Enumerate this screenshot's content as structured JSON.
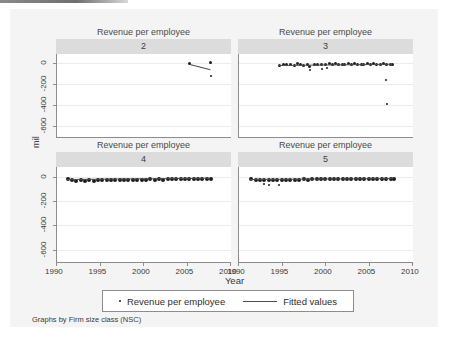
{
  "figure": {
    "y_axis_title": "mil",
    "x_axis_title": "Year",
    "note": "Graphs by Firm size class (NSC)",
    "panel_title": "Revenue per employee",
    "y_ticks": [
      "0",
      "-200",
      "-400",
      "-600"
    ],
    "x_ticks": [
      "1990",
      "1995",
      "2000",
      "2005",
      "2010"
    ],
    "legend": {
      "marker_label": "Revenue per employee",
      "line_label": "Fitted values"
    }
  },
  "chart_data": {
    "type": "scatter",
    "title": "Revenue per employee",
    "subtitle": "Graphs by Firm size class (NSC)",
    "xlabel": "Year",
    "ylabel": "mil",
    "xlim": [
      1990,
      2010
    ],
    "ylim": [
      -700,
      80
    ],
    "xticks": [
      1990,
      1995,
      2000,
      2005,
      2010
    ],
    "yticks": [
      0,
      -200,
      -400,
      -600
    ],
    "grid": true,
    "legend_position": "bottom",
    "legend": [
      "Revenue per employee",
      "Fitted values"
    ],
    "panel_variable": "Firm size class (NSC)",
    "panels": [
      {
        "label": "2",
        "series": [
          {
            "name": "Revenue per employee",
            "type": "scatter",
            "points": [
              {
                "x": 2005.2,
                "y": -8
              },
              {
                "x": 2007.6,
                "y": 5
              },
              {
                "x": 2007.7,
                "y": -128
              }
            ]
          },
          {
            "name": "Fitted values",
            "type": "line",
            "points": [
              {
                "x": 2005.3,
                "y": -14
              },
              {
                "x": 2007.6,
                "y": -62
              }
            ]
          }
        ]
      },
      {
        "label": "3",
        "series": [
          {
            "name": "Revenue per employee",
            "type": "scatter",
            "points": [
              {
                "x": 1994.6,
                "y": -22
              },
              {
                "x": 1995.0,
                "y": -18
              },
              {
                "x": 1995.4,
                "y": -14
              },
              {
                "x": 1995.9,
                "y": -10
              },
              {
                "x": 1996.3,
                "y": -20
              },
              {
                "x": 1996.7,
                "y": -6
              },
              {
                "x": 1997.0,
                "y": -12
              },
              {
                "x": 1997.4,
                "y": -24
              },
              {
                "x": 1997.8,
                "y": -16
              },
              {
                "x": 1998.1,
                "y": -30
              },
              {
                "x": 1998.2,
                "y": -70
              },
              {
                "x": 1998.6,
                "y": -14
              },
              {
                "x": 1999.0,
                "y": -12
              },
              {
                "x": 1999.4,
                "y": -18
              },
              {
                "x": 1999.5,
                "y": -58
              },
              {
                "x": 1999.9,
                "y": -10
              },
              {
                "x": 2000.1,
                "y": -54
              },
              {
                "x": 2000.3,
                "y": -8
              },
              {
                "x": 2000.7,
                "y": -14
              },
              {
                "x": 2001.0,
                "y": -6
              },
              {
                "x": 2001.4,
                "y": -16
              },
              {
                "x": 2001.8,
                "y": -10
              },
              {
                "x": 2002.1,
                "y": -12
              },
              {
                "x": 2002.5,
                "y": -8
              },
              {
                "x": 2002.9,
                "y": -14
              },
              {
                "x": 2003.2,
                "y": -6
              },
              {
                "x": 2003.6,
                "y": -12
              },
              {
                "x": 2004.0,
                "y": -10
              },
              {
                "x": 2004.3,
                "y": -14
              },
              {
                "x": 2004.7,
                "y": -8
              },
              {
                "x": 2005.1,
                "y": -12
              },
              {
                "x": 2005.4,
                "y": -6
              },
              {
                "x": 2005.8,
                "y": -10
              },
              {
                "x": 2006.2,
                "y": -14
              },
              {
                "x": 2006.5,
                "y": -8
              },
              {
                "x": 2006.9,
                "y": -12
              },
              {
                "x": 2006.9,
                "y": -160
              },
              {
                "x": 2007.0,
                "y": -390
              },
              {
                "x": 2007.3,
                "y": -10
              },
              {
                "x": 2007.6,
                "y": -14
              }
            ]
          },
          {
            "name": "Fitted values",
            "type": "line",
            "points": [
              {
                "x": 1994.6,
                "y": -26
              },
              {
                "x": 2007.6,
                "y": -14
              }
            ]
          }
        ]
      },
      {
        "label": "4",
        "series": [
          {
            "name": "Revenue per employee",
            "type": "scatter",
            "points": [
              {
                "x": 1991.2,
                "y": -14
              },
              {
                "x": 1991.6,
                "y": -20
              },
              {
                "x": 1992.1,
                "y": -24
              },
              {
                "x": 1992.6,
                "y": -22
              },
              {
                "x": 1993.1,
                "y": -26
              },
              {
                "x": 1993.6,
                "y": -22
              },
              {
                "x": 1994.1,
                "y": -24
              },
              {
                "x": 1994.6,
                "y": -20
              },
              {
                "x": 1995.1,
                "y": -22
              },
              {
                "x": 1995.6,
                "y": -18
              },
              {
                "x": 1996.1,
                "y": -20
              },
              {
                "x": 1996.6,
                "y": -18
              },
              {
                "x": 1997.1,
                "y": -20
              },
              {
                "x": 1997.6,
                "y": -16
              },
              {
                "x": 1998.1,
                "y": -18
              },
              {
                "x": 1998.6,
                "y": -16
              },
              {
                "x": 1999.1,
                "y": -18
              },
              {
                "x": 1999.6,
                "y": -16
              },
              {
                "x": 2000.1,
                "y": -16
              },
              {
                "x": 2000.6,
                "y": -14
              },
              {
                "x": 2001.1,
                "y": -16
              },
              {
                "x": 2001.6,
                "y": -14
              },
              {
                "x": 2002.1,
                "y": -16
              },
              {
                "x": 2002.6,
                "y": -14
              },
              {
                "x": 2003.1,
                "y": -14
              },
              {
                "x": 2003.6,
                "y": -12
              },
              {
                "x": 2004.1,
                "y": -14
              },
              {
                "x": 2004.6,
                "y": -12
              },
              {
                "x": 2005.1,
                "y": -14
              },
              {
                "x": 2005.6,
                "y": -12
              },
              {
                "x": 2006.1,
                "y": -12
              },
              {
                "x": 2006.6,
                "y": -12
              },
              {
                "x": 2007.1,
                "y": -12
              },
              {
                "x": 2007.6,
                "y": -10
              }
            ]
          },
          {
            "name": "Fitted values",
            "type": "line",
            "points": [
              {
                "x": 1991.2,
                "y": -22
              },
              {
                "x": 2007.6,
                "y": -12
              }
            ]
          }
        ]
      },
      {
        "label": "5",
        "series": [
          {
            "name": "Revenue per employee",
            "type": "scatter",
            "points": [
              {
                "x": 1991.3,
                "y": -12
              },
              {
                "x": 1991.8,
                "y": -16
              },
              {
                "x": 1992.3,
                "y": -18
              },
              {
                "x": 1992.8,
                "y": -18
              },
              {
                "x": 1992.9,
                "y": -62
              },
              {
                "x": 1993.3,
                "y": -20
              },
              {
                "x": 1993.5,
                "y": -66
              },
              {
                "x": 1993.8,
                "y": -18
              },
              {
                "x": 1994.3,
                "y": -18
              },
              {
                "x": 1994.6,
                "y": -70
              },
              {
                "x": 1994.8,
                "y": -16
              },
              {
                "x": 1995.3,
                "y": -18
              },
              {
                "x": 1995.8,
                "y": -16
              },
              {
                "x": 1996.3,
                "y": -16
              },
              {
                "x": 1996.8,
                "y": -16
              },
              {
                "x": 1997.3,
                "y": -14
              },
              {
                "x": 1997.8,
                "y": -16
              },
              {
                "x": 1998.3,
                "y": -14
              },
              {
                "x": 1998.8,
                "y": -14
              },
              {
                "x": 1999.3,
                "y": -14
              },
              {
                "x": 1999.8,
                "y": -12
              },
              {
                "x": 2000.3,
                "y": -14
              },
              {
                "x": 2000.8,
                "y": -12
              },
              {
                "x": 2001.3,
                "y": -12
              },
              {
                "x": 2001.8,
                "y": -12
              },
              {
                "x": 2002.3,
                "y": -12
              },
              {
                "x": 2002.8,
                "y": -10
              },
              {
                "x": 2003.3,
                "y": -12
              },
              {
                "x": 2003.8,
                "y": -10
              },
              {
                "x": 2004.3,
                "y": -10
              },
              {
                "x": 2004.8,
                "y": -10
              },
              {
                "x": 2005.3,
                "y": -10
              },
              {
                "x": 2005.8,
                "y": -10
              },
              {
                "x": 2006.3,
                "y": -8
              },
              {
                "x": 2006.8,
                "y": -10
              },
              {
                "x": 2007.3,
                "y": -8
              },
              {
                "x": 2007.7,
                "y": -8
              }
            ]
          },
          {
            "name": "Fitted values",
            "type": "line",
            "points": [
              {
                "x": 1991.3,
                "y": -18
              },
              {
                "x": 2007.7,
                "y": -10
              }
            ]
          }
        ]
      }
    ]
  }
}
